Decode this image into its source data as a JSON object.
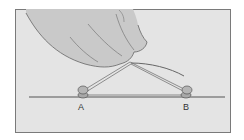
{
  "figure": {
    "pins": [
      {
        "label": "A"
      },
      {
        "label": "B"
      }
    ],
    "colors": {
      "background": "#e4e4e4",
      "frame": "#7a7a7a",
      "hand_fill": "#c9c9c9",
      "outline": "#555555",
      "pin": "#b5b5b5"
    }
  }
}
